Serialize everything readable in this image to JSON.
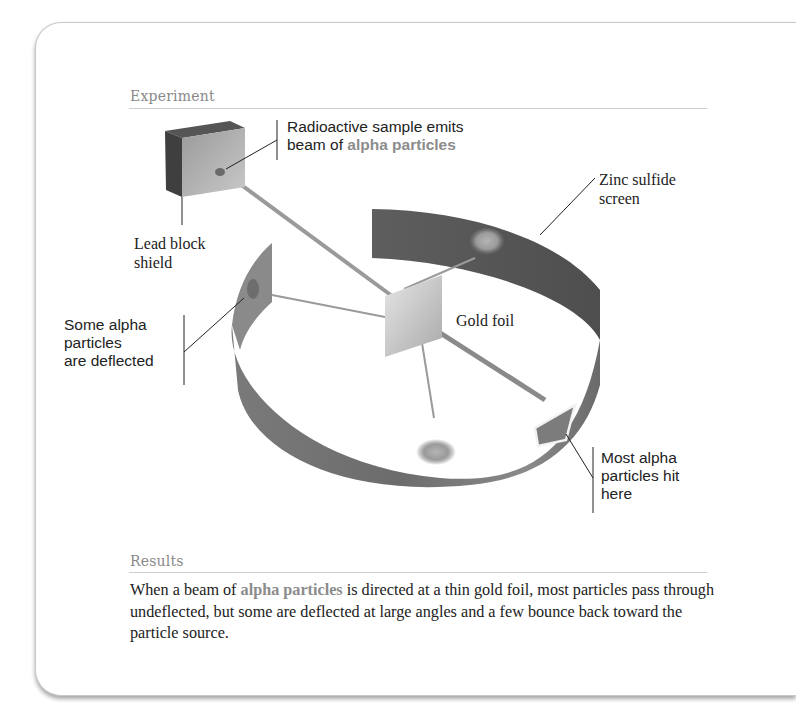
{
  "figure": {
    "experiment_heading": "Experiment",
    "results_heading": "Results",
    "labels": {
      "radioactive_sample_line1": "Radioactive sample emits",
      "radioactive_sample_line2_prefix": "beam of ",
      "radioactive_sample_line2_accent": "alpha particles",
      "zinc_sulfide_line1": "Zinc sulfide",
      "zinc_sulfide_line2": "screen",
      "lead_block_line1": "Lead block",
      "lead_block_line2": "shield",
      "deflected_line1": "Some alpha",
      "deflected_line2": "particles",
      "deflected_line3": "are deflected",
      "gold_foil": "Gold foil",
      "most_hit_line1": "Most alpha",
      "most_hit_line2": "particles hit",
      "most_hit_line3": "here"
    },
    "results": {
      "prefix": "When a beam of ",
      "accent": "alpha particles",
      "suffix": " is directed at a thin gold foil, most particles pass through undeflected, but some are deflected at large angles and a few bounce back toward the particle source."
    },
    "colors": {
      "accent_text": "#8c8c8c",
      "screen_band": "#6f6f6f",
      "beam": "#9a9a9a",
      "heading": "#8a8a8a"
    }
  }
}
